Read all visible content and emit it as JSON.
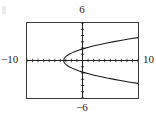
{
  "window": {
    "ymax_label": "6",
    "ymin_label": "−6",
    "xmin_label": "−10",
    "xmax_label": "10"
  },
  "chart_data": {
    "type": "line",
    "title": "",
    "subtitle": "",
    "xlabel": "",
    "ylabel": "",
    "xlim": [
      -10,
      10
    ],
    "ylim": [
      -6,
      6
    ],
    "grid": false,
    "legend": "none",
    "axis_color": "#262626",
    "curve_color": "#1a1a1a",
    "frame_color": "#3b3b3b",
    "background": "#ffffff",
    "x_tick_step": 1,
    "y_tick_step": 1,
    "x_ticks": [
      -10,
      -9,
      -8,
      -7,
      -6,
      -5,
      -4,
      -3,
      -2,
      -1,
      0,
      1,
      2,
      3,
      4,
      5,
      6,
      7,
      8,
      9,
      10
    ],
    "y_ticks": [
      -6,
      -5,
      -4,
      -3,
      -2,
      -1,
      0,
      1,
      2,
      3,
      4,
      5,
      6
    ],
    "annotations": [
      {
        "name": "ymax",
        "text": "6",
        "position": "top-center"
      },
      {
        "name": "ymin",
        "text": "−6",
        "position": "bottom-center"
      },
      {
        "name": "xmin",
        "text": "−10",
        "position": "left-middle"
      },
      {
        "name": "xmax",
        "text": "10",
        "position": "right-middle"
      }
    ],
    "series": [
      {
        "name": "parabola-upper-branch",
        "description": "upper half of rightward-opening parabola",
        "x": [
          -3.4,
          -3.3,
          -3.1,
          -2.8,
          -2.4,
          -1.9,
          -1.3,
          -0.6,
          0.2,
          1.1,
          2.1,
          3.2,
          4.4,
          5.7,
          7.1,
          8.6,
          10.0
        ],
        "y": [
          0.0,
          0.32,
          0.55,
          0.77,
          1.0,
          1.22,
          1.45,
          1.67,
          1.9,
          2.12,
          2.35,
          2.57,
          2.8,
          3.02,
          3.25,
          3.47,
          3.66
        ]
      },
      {
        "name": "parabola-lower-branch",
        "description": "lower half of rightward-opening parabola",
        "x": [
          -3.4,
          -3.3,
          -3.1,
          -2.8,
          -2.4,
          -1.9,
          -1.3,
          -0.6,
          0.2,
          1.1,
          2.1,
          3.2,
          4.4,
          5.7,
          7.1,
          8.6,
          10.0
        ],
        "y": [
          0.0,
          -0.32,
          -0.55,
          -0.77,
          -1.0,
          -1.22,
          -1.45,
          -1.67,
          -1.9,
          -2.12,
          -2.35,
          -2.57,
          -2.8,
          -3.02,
          -3.25,
          -3.47,
          -3.66
        ]
      }
    ],
    "vertex": {
      "x": -3.4,
      "y": 0.0
    }
  }
}
